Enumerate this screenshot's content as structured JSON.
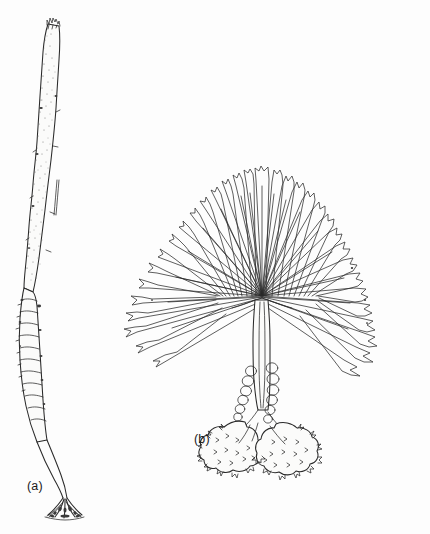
{
  "figure": {
    "kind": "scientific-line-drawing",
    "background_color": "#fdfdfd",
    "ink_color": "#2a2a2a",
    "width": 430,
    "height": 534,
    "panels": [
      {
        "id": "a",
        "label": "(a)",
        "label_x": 27,
        "label_y": 479,
        "description": "Long narrow strap-shaped stipitate blade with corrugated lower stipe and branching root-like holdfast",
        "bbox": {
          "x": 20,
          "y": 18,
          "width": 72,
          "height": 505
        },
        "parts": [
          {
            "name": "blade-apex",
            "note": "jagged torn tip"
          },
          {
            "name": "blade-lamina",
            "note": "stippled elongate blade with longitudinal slit"
          },
          {
            "name": "stipe-corrugated",
            "note": "ridged lower region with transverse ribs"
          },
          {
            "name": "stalk",
            "note": "thin wiry lower stalk"
          },
          {
            "name": "holdfast-haptera",
            "note": "splayed branching root-like holdfast"
          }
        ]
      },
      {
        "id": "b",
        "label": "(b)",
        "label_x": 194,
        "label_y": 432,
        "description": "Fan-shaped palmately divided blade on a beaded stalk with two rugose lobed holdfast masses",
        "bbox": {
          "x": 118,
          "y": 160,
          "width": 300,
          "height": 310
        },
        "fan_center": {
          "x": 262,
          "y": 297
        },
        "fan_segment_count": 46,
        "parts": [
          {
            "name": "fan-blade",
            "note": "radiating palmate segments with truncate notched tips"
          },
          {
            "name": "stipe-beaded",
            "note": "stalk bearing rounded bead-like segments"
          },
          {
            "name": "holdfast-rugose-left",
            "note": "crinkled lobed basal mass"
          },
          {
            "name": "holdfast-rugose-right",
            "note": "crinkled lobed basal mass"
          }
        ]
      }
    ]
  },
  "colors": {
    "background": "#fdfdfd",
    "ink": "#2a2a2a",
    "stipple": "#6f6f6f",
    "label_text": "#1a1a1a"
  }
}
